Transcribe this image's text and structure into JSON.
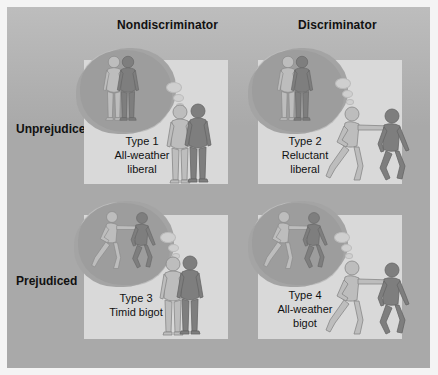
{
  "columns": {
    "nondiscriminator": "Nondiscriminator",
    "discriminator": "Discriminator"
  },
  "rows": {
    "unprejudiced": "Unprejudiced",
    "prejudiced": "Prejudiced"
  },
  "cells": [
    {
      "type": "Type 1",
      "name_line1": "All-weather",
      "name_line2": "liberal",
      "thought": "friendly",
      "action": "friendly"
    },
    {
      "type": "Type 2",
      "name_line1": "Reluctant",
      "name_line2": "liberal",
      "thought": "friendly",
      "action": "pushing"
    },
    {
      "type": "Type 3",
      "name_line1": "Timid bigot",
      "name_line2": "",
      "thought": "pushing",
      "action": "friendly"
    },
    {
      "type": "Type 4",
      "name_line1": "All-weather",
      "name_line2": "bigot",
      "thought": "pushing",
      "action": "pushing"
    }
  ],
  "colors": {
    "frame": "#a9a9a9",
    "panel": "#d9d9d9",
    "bubble": "#9d9d9d",
    "figure_light": "#bcbcbc",
    "figure_dark": "#7f7f7f"
  }
}
